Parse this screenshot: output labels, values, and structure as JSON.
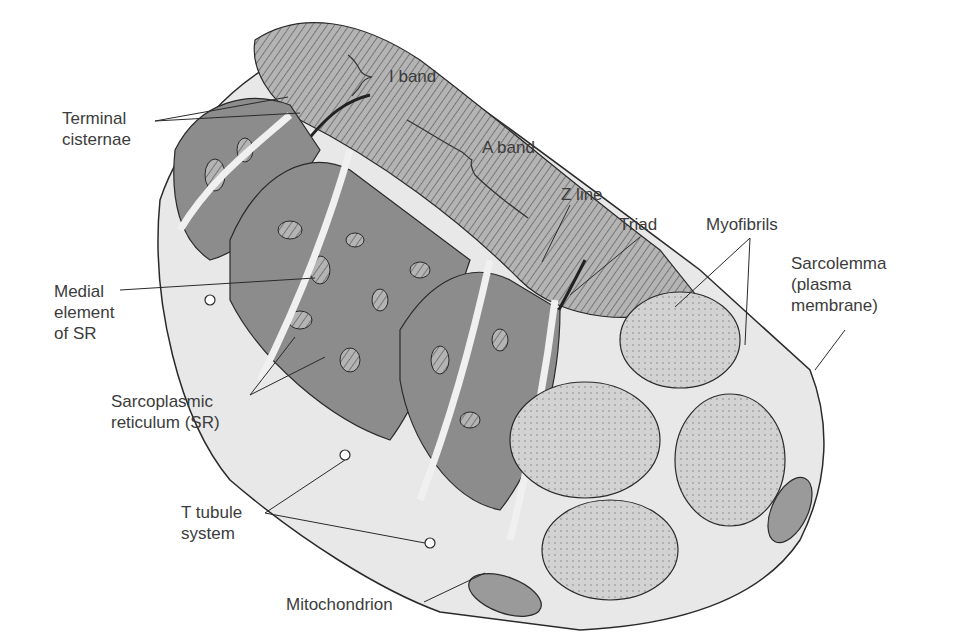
{
  "diagram": {
    "colors": {
      "background": "#ffffff",
      "sr_dark": "#8c8c8c",
      "myofibril_stripe": "#a8a8a8",
      "myofibril_end": "#cfcfcf",
      "sarcoplasm": "#e6e6e6",
      "outline": "#2a2a2a",
      "label_text": "#3c3c3c"
    },
    "labels": {
      "terminal_cisternae": [
        "Terminal",
        "cisternae"
      ],
      "i_band": "I band",
      "a_band": "A band",
      "z_line": "Z line",
      "triad": "Triad",
      "myofibrils": "Myofibrils",
      "sarcolemma": [
        "Sarcolemma",
        "(plasma",
        "membrane)"
      ],
      "medial_element": [
        "Medial",
        "element",
        "of SR"
      ],
      "sarcoplasmic_reticulum": [
        "Sarcoplasmic",
        "reticulum (SR)"
      ],
      "t_tubule": [
        "T tubule",
        "system"
      ],
      "mitochondrion": "Mitochondrion"
    }
  }
}
